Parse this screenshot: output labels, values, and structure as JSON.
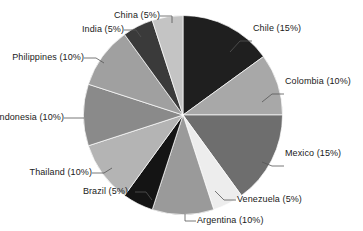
{
  "chart_data": {
    "type": "pie",
    "title": "",
    "subtitle": "",
    "xlabel": "",
    "ylabel": "",
    "legend_position": "none",
    "grid": false,
    "label_format": "{name} ({value}%)",
    "start_angle_deg": 0,
    "direction": "clockwise",
    "units": "percent",
    "total": 100,
    "categories": [
      "Chile",
      "Colombia",
      "Mexico",
      "Venezuela",
      "Argentina",
      "Brazil",
      "Thailand",
      "Indonesia",
      "Philippines",
      "India",
      "China"
    ],
    "values": [
      15,
      10,
      15,
      5,
      10,
      5,
      10,
      10,
      10,
      5,
      5
    ],
    "colors": [
      "#1f1f1f",
      "#a8a8a8",
      "#6e6e6e",
      "#ededed",
      "#9a9a9a",
      "#141414",
      "#b4b4b4",
      "#8a8a8a",
      "#a0a0a0",
      "#3a3a3a",
      "#c4c4c4"
    ],
    "slices": [
      {
        "name": "Chile",
        "value": 15,
        "label": "Chile (15%)",
        "color": "#1f1f1f"
      },
      {
        "name": "Colombia",
        "value": 10,
        "label": "Colombia (10%)",
        "color": "#a8a8a8"
      },
      {
        "name": "Mexico",
        "value": 15,
        "label": "Mexico (15%)",
        "color": "#6e6e6e"
      },
      {
        "name": "Venezuela",
        "value": 5,
        "label": "Venezuela (5%)",
        "color": "#ededed"
      },
      {
        "name": "Argentina",
        "value": 10,
        "label": "Argentina (10%)",
        "color": "#9a9a9a"
      },
      {
        "name": "Brazil",
        "value": 5,
        "label": "Brazil (5%)",
        "color": "#141414"
      },
      {
        "name": "Thailand",
        "value": 10,
        "label": "Thailand (10%)",
        "color": "#b4b4b4"
      },
      {
        "name": "Indonesia",
        "value": 10,
        "label": "Indonesia (10%)",
        "color": "#8a8a8a"
      },
      {
        "name": "Philippines",
        "value": 10,
        "label": "Philippines (10%)",
        "color": "#a0a0a0"
      },
      {
        "name": "India",
        "value": 5,
        "label": "India (5%)",
        "color": "#3a3a3a"
      },
      {
        "name": "China",
        "value": 5,
        "label": "China (5%)",
        "color": "#c4c4c4"
      }
    ]
  },
  "labels": {
    "chile": "Chile (15%)",
    "colombia": "Colombia (10%)",
    "mexico": "Mexico (15%)",
    "venezuela": "Venezuela (5%)",
    "argentina": "Argentina (10%)",
    "brazil": "Brazil (5%)",
    "thailand": "Thailand (10%)",
    "indonesia": "Indonesia (10%)",
    "philippines": "Philippines (10%)",
    "india": "India (5%)",
    "china": "China (5%)"
  },
  "style": {
    "background": "#ffffff",
    "text_color": "#1a1a1a",
    "leader_line_color": "#555555",
    "slice_border_color": "#ffffff"
  }
}
